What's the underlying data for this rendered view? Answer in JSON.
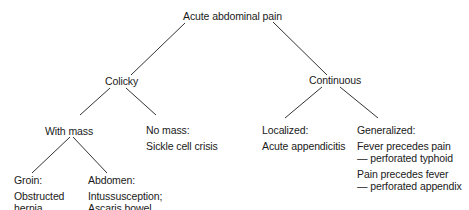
{
  "diagram": {
    "type": "decision-tree",
    "root": "Acute abdominal pain",
    "nodes": {
      "root": {
        "label": "Acute abdominal pain"
      },
      "colicky": {
        "label": "Colicky"
      },
      "continuous": {
        "label": "Continuous"
      },
      "with_mass": {
        "label": "With mass"
      },
      "no_mass": {
        "label": "No mass:",
        "detail": "Sickle cell crisis"
      },
      "groin": {
        "label": "Groin:",
        "detail_lines": [
          "Obstructed",
          "hernia"
        ]
      },
      "abdomen": {
        "label": "Abdomen:",
        "detail_lines": [
          "Intussusception;",
          "Ascaris bowel"
        ]
      },
      "localized": {
        "label": "Localized:",
        "detail": "Acute appendicitis"
      },
      "generalized": {
        "label": "Generalized:",
        "detail_groups": [
          [
            "Fever precedes pain",
            "— perforated typhoid"
          ],
          [
            "Pain precedes fever",
            "— perforated appendix"
          ]
        ]
      }
    },
    "edges": [
      [
        "root",
        "colicky"
      ],
      [
        "root",
        "continuous"
      ],
      [
        "colicky",
        "with_mass"
      ],
      [
        "colicky",
        "no_mass"
      ],
      [
        "with_mass",
        "groin"
      ],
      [
        "with_mass",
        "abdomen"
      ],
      [
        "continuous",
        "localized"
      ],
      [
        "continuous",
        "generalized"
      ]
    ],
    "line_color": "#333333",
    "text_color": "#1a1a1a"
  }
}
